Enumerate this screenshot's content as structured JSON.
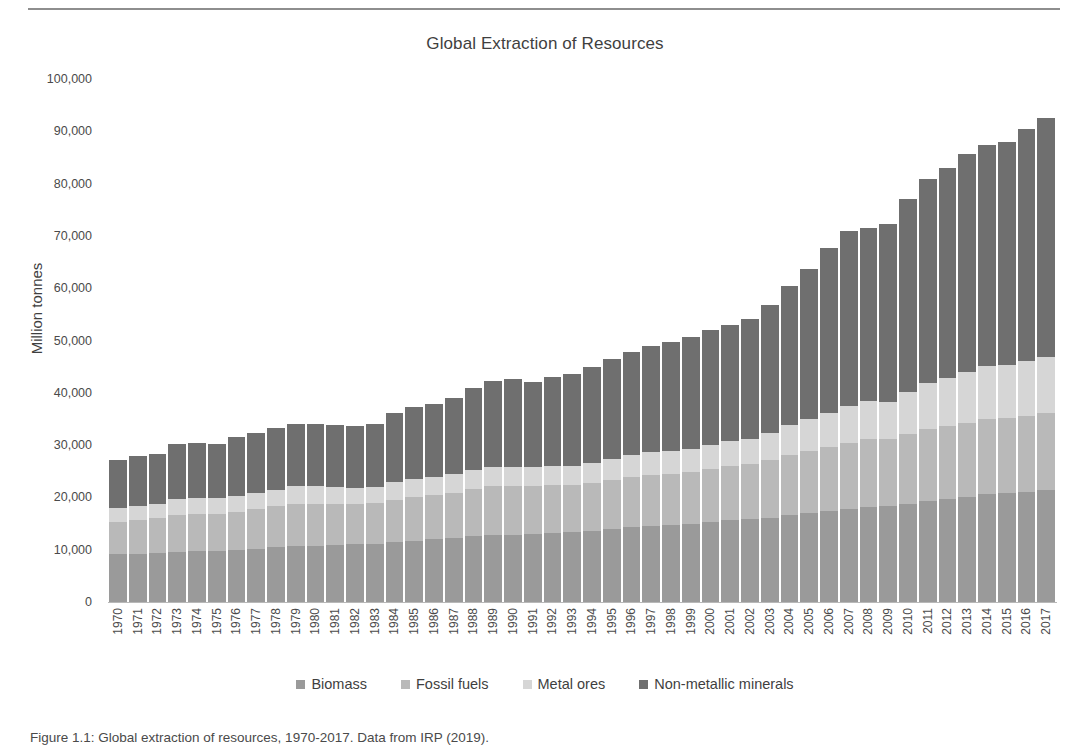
{
  "chart_data": {
    "type": "bar",
    "stacked": true,
    "title": "Global Extraction of Resources",
    "xlabel": "",
    "ylabel": "Million tonnes",
    "ylim": [
      0,
      100000
    ],
    "ytick_values": [
      0,
      10000,
      20000,
      30000,
      40000,
      50000,
      60000,
      70000,
      80000,
      90000,
      100000
    ],
    "ytick_labels": [
      "0",
      "10,000",
      "20,000",
      "30,000",
      "40,000",
      "50,000",
      "60,000",
      "70,000",
      "80,000",
      "90,000",
      "100,000"
    ],
    "grid": false,
    "legend_position": "bottom",
    "categories": [
      "1970",
      "1971",
      "1972",
      "1973",
      "1974",
      "1975",
      "1976",
      "1977",
      "1978",
      "1979",
      "1980",
      "1981",
      "1982",
      "1983",
      "1984",
      "1985",
      "1986",
      "1987",
      "1988",
      "1989",
      "1990",
      "1991",
      "1992",
      "1993",
      "1994",
      "1995",
      "1996",
      "1997",
      "1998",
      "1999",
      "2000",
      "2001",
      "2002",
      "2003",
      "2004",
      "2005",
      "2006",
      "2007",
      "2008",
      "2009",
      "2010",
      "2011",
      "2012",
      "2013",
      "2014",
      "2015",
      "2016",
      "2017"
    ],
    "series": [
      {
        "name": "Biomass",
        "color": "#9a9a9a",
        "values": [
          9100,
          9200,
          9300,
          9600,
          9700,
          9800,
          9900,
          10200,
          10500,
          10700,
          10800,
          10900,
          11000,
          11100,
          11500,
          11700,
          12000,
          12200,
          12600,
          12900,
          12900,
          13000,
          13200,
          13300,
          13600,
          13900,
          14300,
          14500,
          14700,
          15000,
          15300,
          15600,
          15800,
          16100,
          16600,
          17000,
          17400,
          17800,
          18200,
          18400,
          18800,
          19300,
          19700,
          20100,
          20600,
          20800,
          21100,
          21400
        ]
      },
      {
        "name": "Fossil fuels",
        "color": "#b9b9b9",
        "values": [
          6200,
          6500,
          6700,
          7100,
          7100,
          7100,
          7400,
          7600,
          7800,
          8100,
          8000,
          7900,
          7800,
          7800,
          8100,
          8400,
          8500,
          8700,
          9000,
          9200,
          9200,
          9100,
          9100,
          9100,
          9200,
          9400,
          9700,
          9800,
          9800,
          9900,
          10200,
          10400,
          10500,
          11000,
          11500,
          11900,
          12300,
          12700,
          12900,
          12700,
          13300,
          13800,
          14000,
          14200,
          14300,
          14300,
          14400,
          14700
        ]
      },
      {
        "name": "Metal ores",
        "color": "#d6d6d6",
        "values": [
          2600,
          2700,
          2800,
          3000,
          3000,
          2900,
          3000,
          3100,
          3200,
          3300,
          3300,
          3200,
          3100,
          3100,
          3300,
          3400,
          3400,
          3500,
          3700,
          3800,
          3800,
          3700,
          3700,
          3700,
          3800,
          4000,
          4100,
          4300,
          4300,
          4400,
          4600,
          4700,
          4900,
          5200,
          5700,
          6100,
          6500,
          7000,
          7300,
          7200,
          8100,
          8800,
          9200,
          9700,
          10200,
          10300,
          10500,
          10800
        ]
      },
      {
        "name": "Non-metallic minerals",
        "color": "#6f6f6f",
        "values": [
          9300,
          9500,
          9600,
          10500,
          10600,
          10400,
          11200,
          11500,
          11700,
          11900,
          11900,
          11800,
          11800,
          12100,
          13200,
          13700,
          14000,
          14600,
          15700,
          16400,
          16700,
          16200,
          17100,
          17500,
          18300,
          19100,
          19700,
          20300,
          21000,
          21300,
          21900,
          22200,
          23000,
          24500,
          26600,
          28600,
          31400,
          33500,
          33100,
          33900,
          36900,
          38900,
          40000,
          41600,
          42200,
          42500,
          44500,
          45600
        ]
      }
    ]
  },
  "figure": {
    "caption": "Figure 1.1: Global extraction of resources, 1970-2017. Data from IRP (2019)."
  }
}
